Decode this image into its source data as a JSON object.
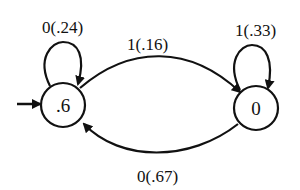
{
  "diagram": {
    "type": "state-transition",
    "states": [
      {
        "id": "s0",
        "label": ".6",
        "initial": true
      },
      {
        "id": "s1",
        "label": "0",
        "initial": false
      }
    ],
    "transitions": [
      {
        "from": "s0",
        "to": "s0",
        "label": "0(.24)"
      },
      {
        "from": "s0",
        "to": "s1",
        "label": "1(.16)"
      },
      {
        "from": "s1",
        "to": "s1",
        "label": "1(.33)"
      },
      {
        "from": "s1",
        "to": "s0",
        "label": "0(.67)"
      }
    ]
  }
}
